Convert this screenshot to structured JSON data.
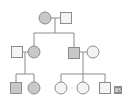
{
  "diagram": {
    "type": "pedigree",
    "colors": {
      "affected_fill": "#c8c8c8",
      "unaffected_fill": "#f4f4f4",
      "stroke": "#8c8c8c",
      "line": "#8c8c8c",
      "label_bg": "#8a8a8a"
    },
    "generations": [
      {
        "id": "I",
        "individuals": [
          {
            "id": "I-1",
            "sex": "female",
            "affected": true
          },
          {
            "id": "I-2",
            "sex": "male",
            "affected": false
          }
        ]
      },
      {
        "id": "II",
        "individuals": [
          {
            "id": "II-1",
            "sex": "male",
            "affected": false
          },
          {
            "id": "II-2",
            "sex": "female",
            "affected": true
          },
          {
            "id": "II-3",
            "sex": "male",
            "affected": true
          },
          {
            "id": "II-4",
            "sex": "female",
            "affected": false
          }
        ]
      },
      {
        "id": "III",
        "individuals": [
          {
            "id": "III-1",
            "sex": "male",
            "affected": true
          },
          {
            "id": "III-2",
            "sex": "female",
            "affected": true
          },
          {
            "id": "III-3",
            "sex": "female",
            "affected": false
          },
          {
            "id": "III-4",
            "sex": "female",
            "affected": false
          },
          {
            "id": "III-5",
            "sex": "male",
            "affected": false
          }
        ]
      }
    ],
    "label": {
      "text": "Ⅲ5",
      "target": "III-5"
    }
  }
}
